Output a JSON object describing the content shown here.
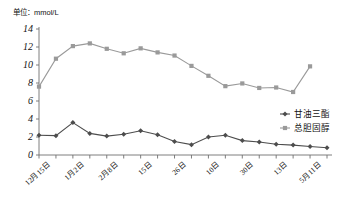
{
  "unit_label": "单位：mmol/L",
  "chart_data": {
    "type": "line",
    "title": "",
    "subtitle": "",
    "unit": "mmol/L",
    "xlabel": "",
    "ylabel": "",
    "ylim": [
      0,
      14
    ],
    "ytick_step": 2,
    "ytick_labels": [
      "0",
      "2",
      "4",
      "6",
      "8",
      "10",
      "12",
      "14"
    ],
    "grid": false,
    "legend_position": "right-middle",
    "x": [
      "12月15日",
      "",
      "1月2日",
      "",
      "2月8日",
      "",
      "15日",
      "",
      "26日",
      "",
      "10日",
      "",
      "30日",
      "",
      "13日",
      "",
      "5月11日",
      ""
    ],
    "xtick_labels_visible": [
      "12月15日",
      "1月2日",
      "2月8日",
      "15日",
      "26日",
      "10日",
      "30日",
      "13日",
      "5月11日"
    ],
    "xtick_label_indices": [
      0,
      2,
      4,
      6,
      8,
      10,
      12,
      14,
      16
    ],
    "series": [
      {
        "name": "甘油三酯",
        "color": "#4d4d4d",
        "marker": "diamond",
        "values": [
          2.2,
          2.15,
          3.6,
          2.4,
          2.1,
          2.3,
          2.7,
          2.25,
          1.5,
          1.15,
          2.0,
          2.2,
          1.6,
          1.45,
          1.2,
          1.1,
          0.95,
          0.8
        ]
      },
      {
        "name": "总胆固醇",
        "color": "#9a9a9a",
        "marker": "square",
        "values": [
          7.6,
          10.7,
          12.1,
          12.4,
          11.8,
          11.3,
          11.85,
          11.4,
          11.05,
          9.9,
          8.8,
          7.65,
          7.95,
          7.45,
          7.5,
          7.0,
          9.85,
          null
        ]
      }
    ],
    "legend": [
      {
        "label": "甘油三酯",
        "color": "#4d4d4d",
        "marker": "diamond"
      },
      {
        "label": "总胆固醇",
        "color": "#9a9a9a",
        "marker": "square"
      }
    ]
  }
}
